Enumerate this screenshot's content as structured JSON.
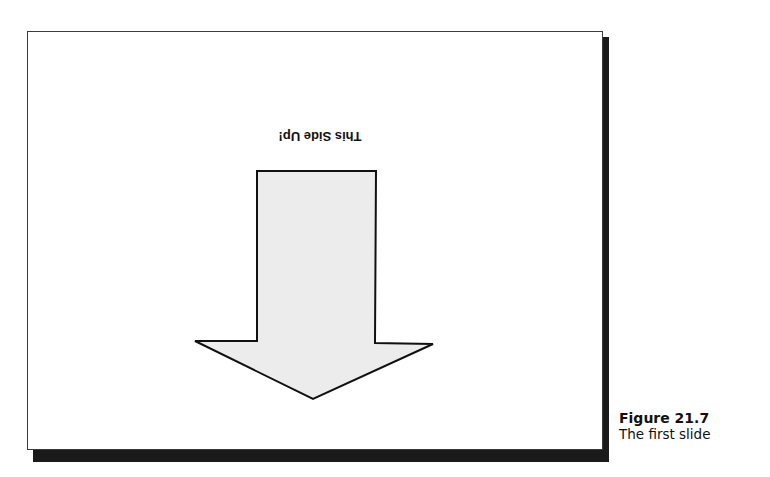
{
  "slide": {
    "text": "This Side Up!",
    "text_orientation": "upside-down",
    "shape": "down-arrow-icon",
    "shape_fill": "#ececec",
    "shape_stroke": "#111111",
    "background": "#ffffff",
    "shadow_color": "#1a1a1a"
  },
  "caption": {
    "title": "Figure 21.7",
    "subtitle": "The first slide"
  }
}
